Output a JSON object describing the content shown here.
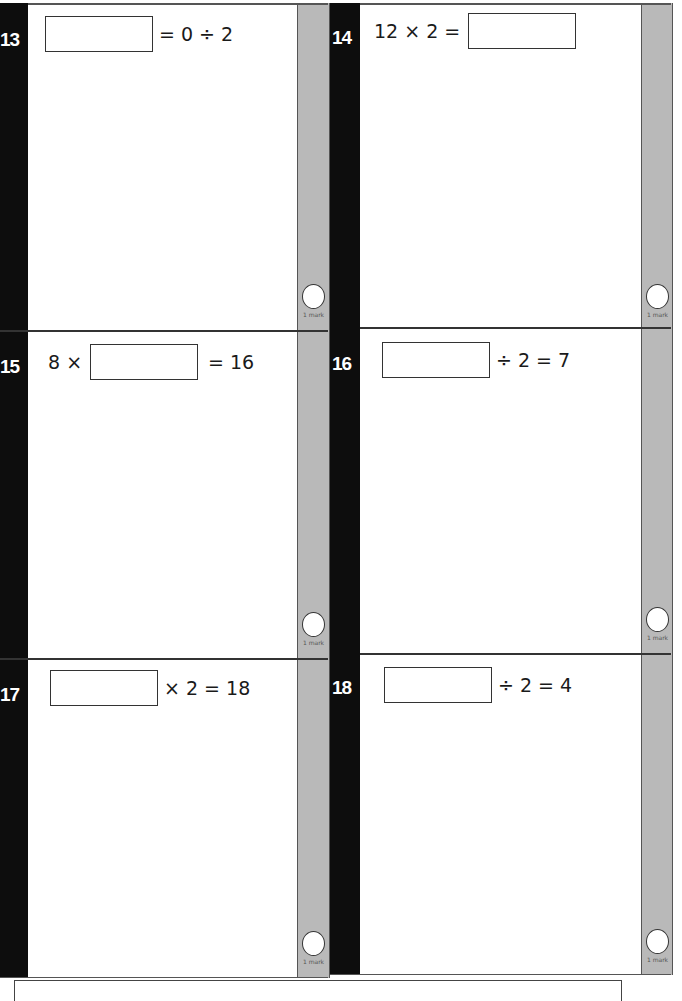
{
  "questions": [
    {
      "number": "13",
      "parts": [
        "[box]",
        "= 0 ÷ 2"
      ],
      "mark_label": "1 mark"
    },
    {
      "number": "14",
      "parts": [
        "12 × 2 =",
        "[box]"
      ],
      "mark_label": "1 mark"
    },
    {
      "number": "15",
      "parts": [
        "8 ×",
        "[box]",
        "= 16"
      ],
      "mark_label": "1 mark"
    },
    {
      "number": "16",
      "parts": [
        "[box]",
        "÷ 2 = 7"
      ],
      "mark_label": "1 mark"
    },
    {
      "number": "17",
      "parts": [
        "[box]",
        "× 2 = 18"
      ],
      "mark_label": "1 mark"
    },
    {
      "number": "18",
      "parts": [
        "[box]",
        "÷ 2 = 4"
      ],
      "mark_label": "1 mark"
    }
  ],
  "colors": {
    "number_bar": "#0d0d0d",
    "mark_strip": "#b9b9b9",
    "border": "#333333"
  }
}
